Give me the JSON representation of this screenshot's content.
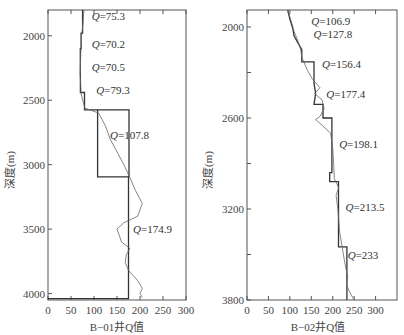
{
  "chart_data": [
    {
      "type": "line",
      "title": "",
      "xlabel": "B−01井Q值",
      "ylabel": "深度(m)",
      "xlim": [
        0,
        300
      ],
      "ylim": [
        4000,
        1800
      ],
      "y_inverted": true,
      "x_ticks": [
        0,
        50,
        100,
        150,
        200,
        250,
        300
      ],
      "y_ticks": [
        2000,
        2500,
        3000,
        3500,
        4000
      ],
      "grid": false,
      "annotations": [
        {
          "text": "Q=75.3",
          "x": 95,
          "depth": 1880
        },
        {
          "text": "Q=70.2",
          "x": 95,
          "depth": 2095
        },
        {
          "text": "Q=70.5",
          "x": 95,
          "depth": 2275
        },
        {
          "text": "Q=79.3",
          "x": 105,
          "depth": 2450
        },
        {
          "text": "Q=107.8",
          "x": 135,
          "depth": 2800
        },
        {
          "text": "Q=174.9",
          "x": 185,
          "depth": 3530
        }
      ],
      "series": [
        {
          "name": "interval Q (step)",
          "style": "step",
          "points": [
            [
              75.3,
              1800
            ],
            [
              75.3,
              1980
            ],
            [
              72,
              1980
            ],
            [
              72,
              2100
            ],
            [
              70.2,
              2100
            ],
            [
              70.2,
              2300
            ],
            [
              70.5,
              2300
            ],
            [
              70.5,
              2440
            ],
            [
              79.3,
              2440
            ],
            [
              79.3,
              2575
            ],
            [
              107.8,
              2575
            ],
            [
              107.8,
              2575
            ],
            [
              176,
              2575
            ],
            [
              176,
              3095
            ],
            [
              107.8,
              3095
            ],
            [
              107.8,
              2575
            ],
            [
              107.8,
              3095
            ],
            [
              174.9,
              3095
            ],
            [
              174.9,
              4040
            ],
            [
              0,
              4040
            ]
          ]
        },
        {
          "name": "continuous Q (smooth)",
          "style": "smooth",
          "points": [
            [
              78,
              1800
            ],
            [
              76,
              1900
            ],
            [
              73,
              2000
            ],
            [
              71,
              2150
            ],
            [
              70,
              2300
            ],
            [
              72,
              2450
            ],
            [
              80,
              2560
            ],
            [
              110,
              2600
            ],
            [
              125,
              2700
            ],
            [
              135,
              2800
            ],
            [
              150,
              2900
            ],
            [
              165,
              3000
            ],
            [
              178,
              3100
            ],
            [
              190,
              3200
            ],
            [
              205,
              3300
            ],
            [
              195,
              3400
            ],
            [
              165,
              3450
            ],
            [
              150,
              3500
            ],
            [
              160,
              3600
            ],
            [
              178,
              3650
            ],
            [
              170,
              3700
            ],
            [
              168,
              3760
            ],
            [
              175,
              3820
            ],
            [
              195,
              3900
            ],
            [
              205,
              3960
            ],
            [
              200,
              4000
            ],
            [
              205,
              4030
            ]
          ]
        }
      ]
    },
    {
      "type": "line",
      "title": "",
      "xlabel": "B−02井Q值",
      "ylabel": "深度(m)",
      "xlim": [
        0,
        350
      ],
      "ylim": [
        3800,
        1888
      ],
      "y_inverted": true,
      "x_ticks": [
        0,
        50,
        100,
        150,
        200,
        250,
        300
      ],
      "y_ticks": [
        2000,
        2600,
        3200,
        3800
      ],
      "grid": false,
      "annotations": [
        {
          "text": "Q=106.9",
          "x": 150,
          "depth": 1990
        },
        {
          "text": "Q=127.8",
          "x": 155,
          "depth": 2075
        },
        {
          "text": "Q=156.4",
          "x": 175,
          "depth": 2270
        },
        {
          "text": "Q=177.4",
          "x": 185,
          "depth": 2470
        },
        {
          "text": "Q=198.1",
          "x": 215,
          "depth": 2800
        },
        {
          "text": "Q=213.5",
          "x": 230,
          "depth": 3210
        },
        {
          "text": "Q=233",
          "x": 235,
          "depth": 3530
        }
      ],
      "series": [
        {
          "name": "interval Q (step)",
          "style": "step",
          "points": [
            [
              95,
              1888
            ],
            [
              100,
              1950
            ],
            [
              106.9,
              2010
            ],
            [
              110,
              2060
            ],
            [
              118,
              2100
            ],
            [
              127.8,
              2150
            ],
            [
              127.8,
              2230
            ],
            [
              156.4,
              2230
            ],
            [
              156.4,
              2370
            ],
            [
              160,
              2440
            ],
            [
              156.4,
              2510
            ],
            [
              177.4,
              2510
            ],
            [
              177.4,
              2600
            ],
            [
              198.1,
              2600
            ],
            [
              198.1,
              2960
            ],
            [
              193,
              2960
            ],
            [
              193,
              3020
            ],
            [
              213.5,
              3020
            ],
            [
              213.5,
              3450
            ],
            [
              233,
              3450
            ],
            [
              233,
              3800
            ]
          ]
        },
        {
          "name": "continuous Q (smooth)",
          "style": "smooth",
          "points": [
            [
              95,
              1888
            ],
            [
              103,
              1960
            ],
            [
              110,
              2030
            ],
            [
              120,
              2100
            ],
            [
              125,
              2150
            ],
            [
              128,
              2200
            ],
            [
              140,
              2280
            ],
            [
              152,
              2340
            ],
            [
              170,
              2400
            ],
            [
              158,
              2440
            ],
            [
              175,
              2480
            ],
            [
              180,
              2540
            ],
            [
              170,
              2590
            ],
            [
              160,
              2610
            ],
            [
              180,
              2660
            ],
            [
              195,
              2700
            ],
            [
              200,
              2800
            ],
            [
              202,
              2900
            ],
            [
              204,
              3000
            ],
            [
              214,
              3060
            ],
            [
              208,
              3110
            ],
            [
              212,
              3200
            ],
            [
              216,
              3350
            ],
            [
              222,
              3450
            ],
            [
              228,
              3550
            ],
            [
              235,
              3650
            ],
            [
              232,
              3700
            ],
            [
              240,
              3750
            ],
            [
              250,
              3800
            ]
          ]
        }
      ]
    }
  ]
}
